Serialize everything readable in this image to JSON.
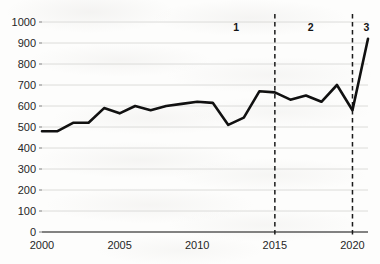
{
  "chart_data": {
    "type": "line",
    "title": "",
    "subtitle": "",
    "xlabel": "",
    "ylabel": "",
    "xlim": [
      2000,
      2021
    ],
    "ylim": [
      0,
      1000
    ],
    "grid": true,
    "legend": "none",
    "x_tick_labels": [
      "2000",
      "2005",
      "2010",
      "2015",
      "2020"
    ],
    "x_ticks": [
      2000,
      2005,
      2010,
      2015,
      2020
    ],
    "y_tick_labels": [
      "0",
      "100",
      "200",
      "300",
      "400",
      "500",
      "600",
      "700",
      "800",
      "900",
      "1000"
    ],
    "y_ticks": [
      0,
      100,
      200,
      300,
      400,
      500,
      600,
      700,
      800,
      900,
      1000
    ],
    "x": [
      2000,
      2001,
      2002,
      2003,
      2004,
      2005,
      2006,
      2007,
      2008,
      2009,
      2010,
      2011,
      2012,
      2013,
      2014,
      2015,
      2016,
      2017,
      2018,
      2019,
      2020,
      2021
    ],
    "values": [
      480,
      480,
      520,
      520,
      590,
      565,
      600,
      580,
      600,
      610,
      620,
      615,
      510,
      545,
      670,
      665,
      630,
      650,
      620,
      700,
      580,
      920
    ],
    "series": [
      {
        "name": "",
        "color": "#111111",
        "values": [
          480,
          480,
          520,
          520,
          590,
          565,
          600,
          580,
          600,
          610,
          620,
          615,
          510,
          545,
          670,
          665,
          630,
          650,
          620,
          700,
          580,
          920
        ]
      }
    ],
    "annotations": [
      {
        "name": "region-1",
        "label": "1",
        "x": 2012.5,
        "y": 955
      },
      {
        "name": "region-2",
        "label": "2",
        "x": 2017.3,
        "y": 955
      },
      {
        "name": "region-3",
        "label": "3",
        "x": 2020.9,
        "y": 955
      }
    ],
    "vertical_dashed_lines": [
      {
        "name": "divider-2015",
        "x": 2015,
        "color": "#1a1a1a"
      },
      {
        "name": "divider-2020",
        "x": 2020,
        "color": "#1a1a1a"
      }
    ]
  }
}
